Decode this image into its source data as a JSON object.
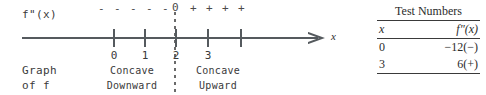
{
  "diagram": {
    "function_label": "f\"(x)",
    "axis_variable": "x",
    "graph_label_line1": "Graph",
    "graph_label_line2": "of f",
    "tick_labels": [
      "0",
      "1",
      "2",
      "3"
    ],
    "sign_left": [
      "-",
      "-",
      "-",
      "-",
      "-"
    ],
    "zero_label": "0",
    "sign_right": [
      "+",
      "+",
      "+",
      "+"
    ],
    "regions": [
      {
        "line1": "Concave",
        "line2": "Downward"
      },
      {
        "line1": "Concave",
        "line2": "Upward"
      }
    ],
    "colors": {
      "axis": "#555a5e",
      "text": "#3a3a3a",
      "divider": "#6a6a6a"
    }
  },
  "test_numbers": {
    "caption": "Test Numbers",
    "columns": [
      "x",
      "f\"(x)"
    ],
    "rows": [
      {
        "x": "0",
        "value": "−12(−)"
      },
      {
        "x": "3",
        "value": "6(+)"
      }
    ]
  }
}
